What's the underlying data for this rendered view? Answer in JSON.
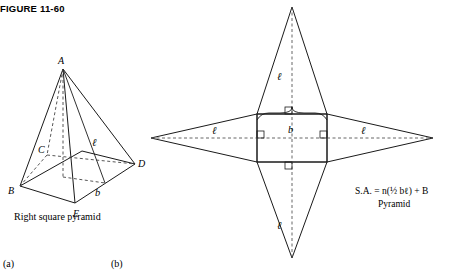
{
  "figure": {
    "number_label": "FIGURE 11-60"
  },
  "panels": {
    "a": {
      "key": "(a)",
      "caption": "Right square pyramid",
      "vertex_labels": [
        "A",
        "B",
        "C",
        "D",
        "E"
      ],
      "edge_labels": [
        "ℓ",
        "b"
      ]
    },
    "b": {
      "key": "(b)",
      "net_labels": [
        "ℓ",
        "ℓ",
        "ℓ",
        "ℓ",
        "b"
      ],
      "formula": "S.A. = n(½ bℓ) + B",
      "formula_caption": "Pyramid"
    }
  },
  "colors": {
    "stroke": "#1a1a1a",
    "dashed": "#555555",
    "background": "#ffffff"
  }
}
